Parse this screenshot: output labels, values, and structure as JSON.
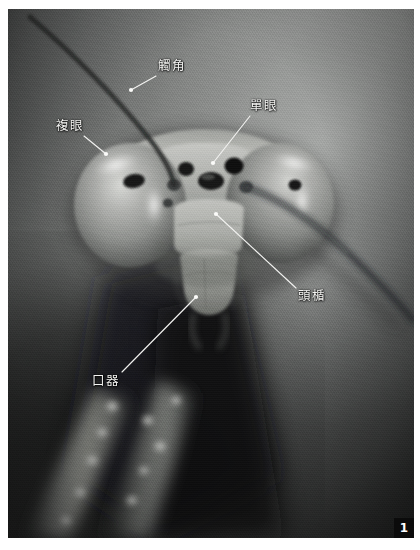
{
  "figure": {
    "number": "1",
    "color_mode": "grayscale"
  },
  "annotations": [
    {
      "id": "antenna",
      "label": "觸角",
      "label_x": 158,
      "label_y": 60,
      "leader": {
        "x1": 156,
        "y1": 76,
        "x2": 131,
        "y2": 90
      },
      "dot": {
        "x": 131,
        "y": 90
      }
    },
    {
      "id": "compound-eye",
      "label": "複眼",
      "label_x": 56,
      "label_y": 120,
      "leader": {
        "x1": 84,
        "y1": 136,
        "x2": 106,
        "y2": 154
      },
      "dot": {
        "x": 106,
        "y": 154
      }
    },
    {
      "id": "ocellus",
      "label": "單眼",
      "label_x": 250,
      "label_y": 100,
      "leader": {
        "x1": 250,
        "y1": 116,
        "x2": 213,
        "y2": 163
      },
      "dot": {
        "x": 213,
        "y": 163
      }
    },
    {
      "id": "clypeus",
      "label": "頭楯",
      "label_x": 298,
      "label_y": 290,
      "leader": {
        "x1": 296,
        "y1": 288,
        "x2": 216,
        "y2": 214
      },
      "dot": {
        "x": 216,
        "y": 214
      }
    },
    {
      "id": "mouthparts",
      "label": "口器",
      "label_x": 92,
      "label_y": 375,
      "leader": {
        "x1": 122,
        "y1": 372,
        "x2": 196,
        "y2": 297
      },
      "dot": {
        "x": 196,
        "y": 297
      }
    }
  ],
  "colors": {
    "plate_background": "#6d6f6e",
    "label_text": "#f4f4f2",
    "leader_line": "#f2f2f0",
    "badge_background": "#0b0b0b",
    "badge_text": "#ffffff",
    "page_background": "#ffffff"
  }
}
